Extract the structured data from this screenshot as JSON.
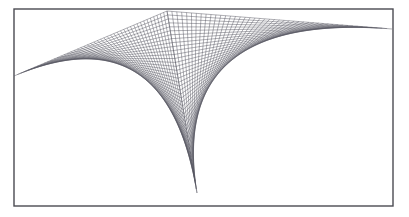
{
  "figure": {
    "canvas": {
      "width": 409,
      "height": 217,
      "background": "#ffffff"
    },
    "frame": {
      "x": 14,
      "y": 9,
      "width": 379,
      "height": 197,
      "stroke_color": "#4a4a52",
      "stroke_width": 1.4,
      "fill": "#ffffff"
    },
    "line_style": {
      "stroke_color": "#555560",
      "stroke_width": 0.55,
      "opacity": 0.85
    },
    "families": [
      {
        "name": "left-fan",
        "count": 46,
        "from": {
          "x0": 167,
          "y0": 11,
          "x1": 14,
          "y1": 76
        },
        "to": {
          "x0": 167,
          "y0": 11,
          "x1": 197,
          "y1": 193
        },
        "note": "segments join point i on upper-left ray to point (n-i) on lower ray"
      },
      {
        "name": "right-fan",
        "count": 46,
        "from": {
          "x0": 167,
          "y0": 11,
          "x1": 392,
          "y1": 29
        },
        "to": {
          "x0": 167,
          "y0": 11,
          "x1": 197,
          "y1": 193
        },
        "note": "segments join point i on upper-right ray to point (n-i) on lower ray"
      }
    ],
    "cusp": {
      "x": 168,
      "y": 70,
      "label": "caustic-cusp"
    },
    "vertex_bottom": {
      "x": 197,
      "y": 193
    },
    "vertex_top": {
      "x": 167,
      "y": 11
    }
  }
}
